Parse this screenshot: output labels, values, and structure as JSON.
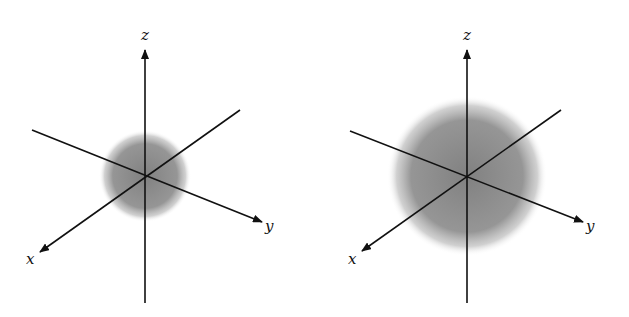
{
  "diagrams": [
    {
      "name": "small-orbital",
      "center": [
        145,
        176
      ],
      "sphere_radius": 44,
      "labels": {
        "z": "z",
        "y": "y",
        "x": "x"
      }
    },
    {
      "name": "large-orbital",
      "center": [
        467,
        176
      ],
      "sphere_radius": 78,
      "labels": {
        "z": "z",
        "y": "y",
        "x": "x"
      }
    }
  ],
  "colors": {
    "sphere": "#7a7a7a",
    "axis": "#111111"
  }
}
